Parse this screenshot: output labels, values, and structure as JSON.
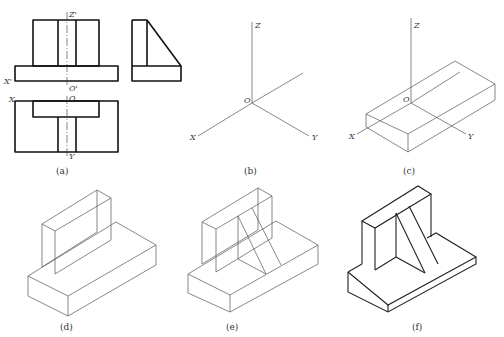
{
  "figure": {
    "panels": [
      {
        "id": "a",
        "caption": "(a)",
        "description": "Three orthographic views with projection axes",
        "labels": {
          "z_prime": "Z'",
          "x_prime": "X'",
          "o_prime": "O'",
          "x": "X",
          "o": "O",
          "y": "Y"
        }
      },
      {
        "id": "b",
        "caption": "(b)",
        "description": "Isometric axes",
        "labels": {
          "z": "Z",
          "o": "O",
          "x": "X",
          "y": "Y"
        }
      },
      {
        "id": "c",
        "caption": "(c)",
        "description": "Base plate drawn on isometric axes",
        "labels": {
          "z": "Z",
          "o": "O",
          "x": "X",
          "y": "Y"
        }
      },
      {
        "id": "d",
        "caption": "(d)",
        "description": "Upright plate added on base"
      },
      {
        "id": "e",
        "caption": "(e)",
        "description": "Triangular rib added"
      },
      {
        "id": "f",
        "caption": "(f)",
        "description": "Final isometric with hidden lines removed and outlines thickened"
      }
    ]
  }
}
